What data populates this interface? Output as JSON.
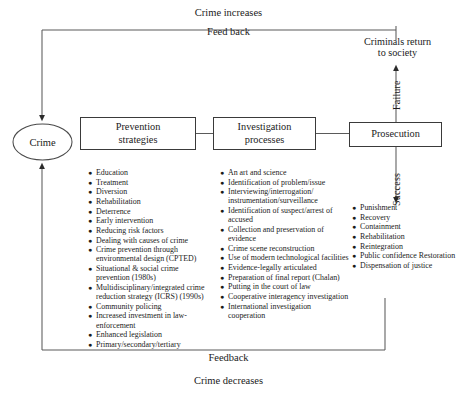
{
  "diagram": {
    "title_top_primary": "Crime increases",
    "title_top_secondary": "Feed back",
    "criminals_return": "Criminals return\nto society",
    "bottom_primary": "Feedback",
    "bottom_secondary": "Crime decreases",
    "crime_node": "Crime",
    "edge_failure": "Failure",
    "edge_success": "Success"
  },
  "boxes": {
    "prevention": "Prevention\nstrategies",
    "investigation": "Investigation\nprocesses",
    "prosecution": "Prosecution"
  },
  "lists": {
    "prevention": [
      "Education",
      "Treatment",
      "Diversion",
      "Rehabilitation",
      "Deterrence",
      "Early intervention",
      "Reducing risk factors",
      "Dealing with causes of crime",
      "Crime prevention through environmental design (CPTED)",
      "Situational & social crime prevention  (1980s)",
      "Multidisciplinary/integrated crime reduction strategy (ICRS) (1990s)",
      "Community policing",
      "Increased investment in law-enforcement",
      "Enhanced legislation",
      "Primary/secondary/tertiary"
    ],
    "investigation": [
      "An art and science",
      "Identification of problem/issue",
      "Interviewing/interrogation/ instrumentation/surveillance",
      "Identification of suspect/arrest of accused",
      "Collection and preservation of evidence",
      "Crime scene reconstruction",
      "Use of modern technological facilities",
      "Evidence-legally articulated",
      "Preparation of final report (Chalan)",
      "Putting in the court of law",
      "Cooperative interagency investigation",
      "International investigation cooperation"
    ],
    "prosecution": [
      "Punishment",
      "Recovery",
      "Containment",
      "Rehabilitation",
      "Reintegration",
      "Public confidence Restoration",
      "Dispensation of justice"
    ]
  },
  "colors": {
    "stroke": "#3a3a3a",
    "text": "#1b1b1b",
    "background": "#ffffff"
  }
}
